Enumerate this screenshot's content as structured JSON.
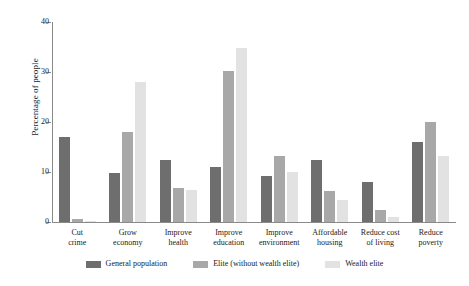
{
  "chart_data": {
    "type": "bar",
    "title": "",
    "xlabel": "",
    "ylabel": "Percentage of people",
    "ylim": [
      0,
      40
    ],
    "yticks": [
      0,
      10,
      20,
      30,
      40
    ],
    "ytick_labels": [
      "0",
      "10",
      "20",
      "30",
      "40"
    ],
    "grid": false,
    "legend_position": "bottom",
    "categories": [
      "Cut crime",
      "Grow economy",
      "Improve health",
      "Improve education",
      "Improve environment",
      "Affordable housing",
      "Reduce cost of living",
      "Reduce poverty"
    ],
    "category_lines": [
      [
        "Cut",
        "crime"
      ],
      [
        "Grow",
        "economy"
      ],
      [
        "Improve",
        "health"
      ],
      [
        "Improve",
        "education"
      ],
      [
        "Improve",
        "environment"
      ],
      [
        "Affordable",
        "housing"
      ],
      [
        "Reduce cost",
        "of living"
      ],
      [
        "Reduce",
        "poverty"
      ]
    ],
    "series": [
      {
        "name": "General population",
        "color": "#6e6e6e",
        "values": [
          17.0,
          9.8,
          12.4,
          11.0,
          9.3,
          12.4,
          8.0,
          16.0
        ]
      },
      {
        "name": "Elite (without wealth elite)",
        "color": "#a8a8a8",
        "values": [
          0.7,
          18.0,
          6.8,
          30.2,
          13.3,
          6.3,
          2.4,
          20.0
        ]
      },
      {
        "name": "Wealth elite",
        "color": "#e2e2e2",
        "values": [
          0.2,
          28.0,
          6.5,
          34.8,
          10.0,
          4.5,
          1.0,
          13.3
        ]
      }
    ]
  },
  "axis": {
    "y_title": "Percentage of people"
  }
}
